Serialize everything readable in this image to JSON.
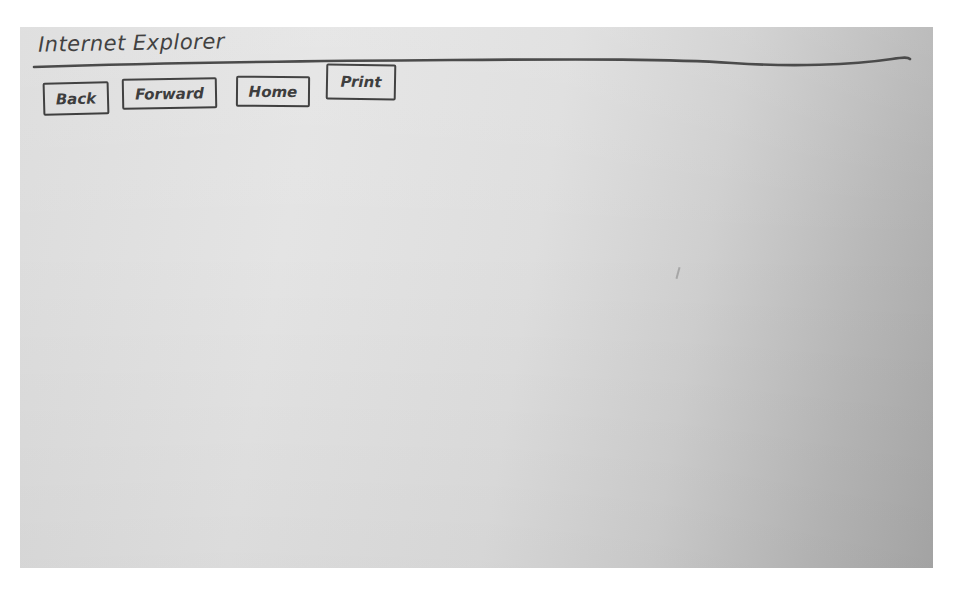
{
  "window": {
    "title": "Internet Explorer"
  },
  "toolbar": {
    "buttons": [
      {
        "id": "back",
        "label": "Back"
      },
      {
        "id": "forward",
        "label": "Forward"
      },
      {
        "id": "home",
        "label": "Home"
      },
      {
        "id": "print",
        "label": "Print"
      }
    ]
  },
  "style": {
    "ink_color": "#333333",
    "paper_color_light": "#e4e4e4",
    "paper_color_dark": "#a9a9a9"
  }
}
